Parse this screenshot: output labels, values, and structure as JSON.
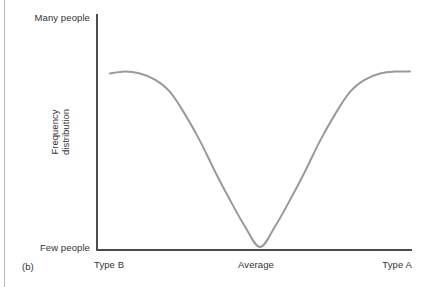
{
  "figure": {
    "tag": "(b)",
    "y_axis_title_line1": "Frequency",
    "y_axis_title_line2": "distribution",
    "y_top_label": "Many people",
    "y_bottom_label": "Few people",
    "x_left_label": "Type B",
    "x_center_label": "Average",
    "x_right_label": "Type A",
    "axis_color": "#4d4d4d",
    "curve_color": "#9a9a9a",
    "background_color": "#ffffff"
  },
  "chart_data": {
    "type": "line",
    "title": "",
    "subtitle": "",
    "xlabel": "",
    "ylabel": "Frequency distribution",
    "grid": false,
    "legend": "none",
    "annotations": [
      "(b)"
    ],
    "x_tick_labels": [
      "Type B",
      "Average",
      "Type A"
    ],
    "y_tick_labels": [
      "Few people",
      "Many people"
    ],
    "xlim": [
      0,
      100
    ],
    "ylim": [
      0,
      100
    ],
    "series": [
      {
        "name": "Frequency distribution",
        "x": [
          0,
          5,
          10,
          15,
          20,
          25,
          30,
          35,
          40,
          45,
          50,
          55,
          60,
          65,
          70,
          75,
          80,
          85,
          90,
          95,
          100
        ],
        "y": [
          86,
          87,
          86,
          83,
          77,
          66,
          53,
          38,
          24,
          11,
          1,
          11,
          24,
          38,
          53,
          66,
          77,
          83,
          86,
          87,
          87
        ]
      }
    ]
  }
}
